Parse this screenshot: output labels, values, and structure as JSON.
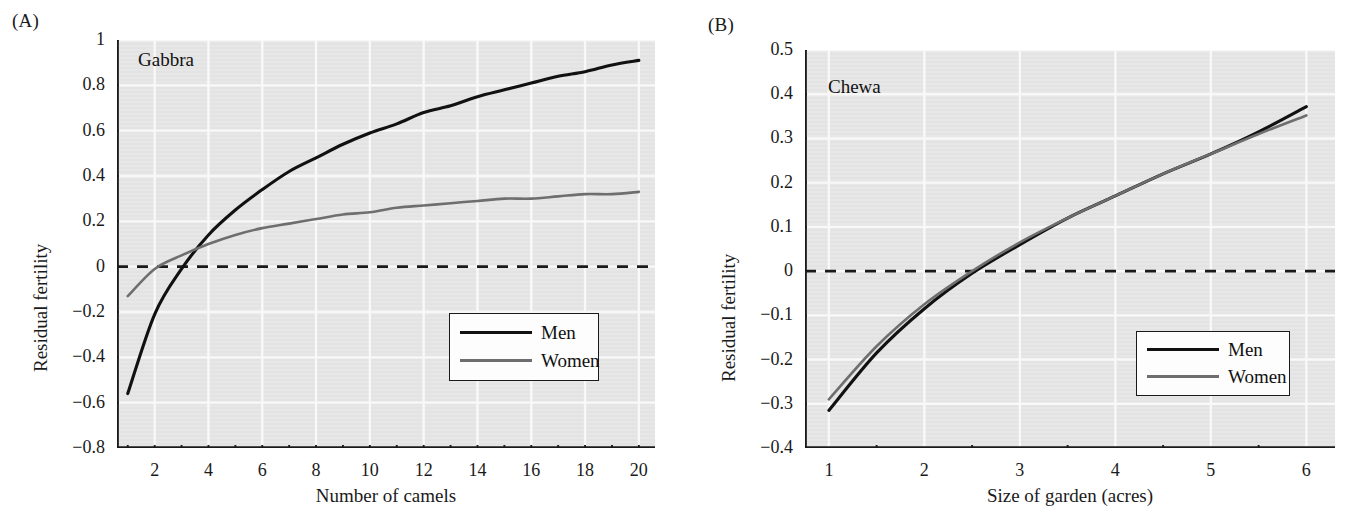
{
  "figure": {
    "panels": [
      {
        "tag": "(A)",
        "group_label": "Gabbra",
        "xlabel": "Number of camels",
        "ylabel": "Residual fertility",
        "xticks": [
          1,
          2,
          3,
          4,
          5,
          6,
          7,
          8,
          9,
          10,
          11,
          12,
          13,
          14,
          15,
          16,
          17,
          18,
          19,
          20
        ],
        "xticklabels": [
          "2",
          "4",
          "6",
          "8",
          "10",
          "12",
          "14",
          "16",
          "18",
          "20"
        ],
        "xticklabel_values": [
          2,
          4,
          6,
          8,
          10,
          12,
          14,
          16,
          18,
          20
        ],
        "yticklabels": [
          "1",
          "0.8",
          "0.6",
          "0.4",
          "0.2",
          "0",
          "−0.2",
          "−0.4",
          "−0.6",
          "−0.8"
        ],
        "ytickvalues": [
          1,
          0.8,
          0.6,
          0.4,
          0.2,
          0,
          -0.2,
          -0.4,
          -0.6,
          -0.8
        ],
        "legend": {
          "men": "Men",
          "women": "Women"
        }
      },
      {
        "tag": "(B)",
        "group_label": "Chewa",
        "xlabel": "Size of garden (acres)",
        "ylabel": "Residual fertility",
        "xticks": [
          1.5,
          2.5,
          3.5,
          4.5,
          5.5
        ],
        "xticklabels": [
          "1",
          "2",
          "3",
          "4",
          "5",
          "6"
        ],
        "xticklabel_values": [
          1,
          2,
          3,
          4,
          5,
          6
        ],
        "yticklabels": [
          "0.5",
          "0.4",
          "0.3",
          "0.2",
          "0.1",
          "0",
          "−0.1",
          "−0.2",
          "−0.3",
          "−0.4"
        ],
        "ytickvalues": [
          0.5,
          0.4,
          0.3,
          0.2,
          0.1,
          0,
          -0.1,
          -0.2,
          -0.3,
          -0.4
        ],
        "legend": {
          "men": "Men",
          "women": "Women"
        }
      }
    ]
  },
  "style": {
    "men_color": "#111111",
    "women_color": "#6e6e6e",
    "plot_background": "#e3e3e3",
    "gridline_color": "#fafafa",
    "axis_color": "#1a1a1a",
    "zero_line_color": "#1a1a1a"
  },
  "chart_data": [
    {
      "type": "line",
      "title": "Gabbra",
      "panel": "(A)",
      "xlabel": "Number of camels",
      "ylabel": "Residual fertility",
      "xlim": [
        0.6,
        20.6
      ],
      "ylim": [
        -0.8,
        1.0
      ],
      "grid": true,
      "legend_position": "lower-right-inside",
      "annotations": [
        "dashed horizontal reference line at y = 0"
      ],
      "x": [
        1,
        2,
        3,
        4,
        5,
        6,
        7,
        8,
        9,
        10,
        11,
        12,
        13,
        14,
        15,
        16,
        17,
        18,
        19,
        20
      ],
      "series": [
        {
          "name": "Men",
          "color": "#111111",
          "values": [
            -0.56,
            -0.21,
            -0.01,
            0.14,
            0.25,
            0.34,
            0.42,
            0.48,
            0.54,
            0.59,
            0.63,
            0.68,
            0.71,
            0.75,
            0.78,
            0.81,
            0.84,
            0.86,
            0.89,
            0.91
          ]
        },
        {
          "name": "Women",
          "color": "#6e6e6e",
          "values": [
            -0.13,
            -0.01,
            0.05,
            0.1,
            0.14,
            0.17,
            0.19,
            0.21,
            0.23,
            0.24,
            0.26,
            0.27,
            0.28,
            0.29,
            0.3,
            0.3,
            0.31,
            0.32,
            0.32,
            0.33
          ]
        }
      ],
      "zero_line": 0
    },
    {
      "type": "line",
      "title": "Chewa",
      "panel": "(B)",
      "xlabel": "Size of garden (acres)",
      "ylabel": "Residual fertility",
      "xlim": [
        0.75,
        6.3
      ],
      "ylim": [
        -0.4,
        0.5
      ],
      "grid": true,
      "legend_position": "lower-right-inside",
      "annotations": [
        "dashed horizontal reference line at y = 0"
      ],
      "x": [
        1,
        1.5,
        2,
        2.5,
        3,
        3.5,
        4,
        4.5,
        5,
        5.5,
        6
      ],
      "series": [
        {
          "name": "Men",
          "color": "#111111",
          "values": [
            -0.315,
            -0.185,
            -0.085,
            -0.005,
            0.06,
            0.12,
            0.17,
            0.22,
            0.265,
            0.315,
            0.372
          ]
        },
        {
          "name": "Women",
          "color": "#6e6e6e",
          "values": [
            -0.29,
            -0.17,
            -0.075,
            0.0,
            0.065,
            0.12,
            0.17,
            0.22,
            0.265,
            0.31,
            0.352
          ]
        }
      ],
      "zero_line": 0
    }
  ]
}
